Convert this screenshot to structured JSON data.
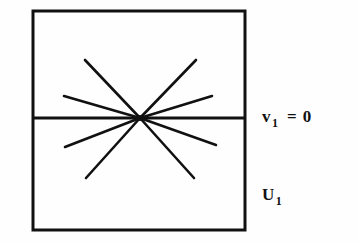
{
  "figure": {
    "kind": "math-diagram",
    "stroke_color": "#111111",
    "background_color": "#fefefe",
    "box": {
      "x": 33,
      "y": 11,
      "width": 212,
      "height": 219,
      "stroke_width": 3
    },
    "divider_line": {
      "x1": 33,
      "y1": 118,
      "x2": 245,
      "y2": 118,
      "stroke_width": 3
    },
    "center_point": {
      "x": 140,
      "y": 118
    },
    "rays": [
      {
        "name": "ray-upper-left-outer",
        "x": 64,
        "y": 96,
        "half": "upper"
      },
      {
        "name": "ray-upper-left-inner",
        "x": 85,
        "y": 60,
        "half": "upper"
      },
      {
        "name": "ray-upper-right-inner",
        "x": 196,
        "y": 60,
        "half": "upper"
      },
      {
        "name": "ray-upper-right-outer",
        "x": 212,
        "y": 96,
        "half": "upper"
      },
      {
        "name": "ray-lower-left-outer",
        "x": 65,
        "y": 147,
        "half": "lower"
      },
      {
        "name": "ray-lower-left-inner",
        "x": 86,
        "y": 178,
        "half": "lower"
      },
      {
        "name": "ray-lower-right-inner",
        "x": 194,
        "y": 178,
        "half": "lower"
      },
      {
        "name": "ray-lower-right-outer",
        "x": 216,
        "y": 145,
        "half": "lower"
      }
    ]
  },
  "labels": {
    "upper": {
      "symbol": "v",
      "subscript": "1",
      "operator": "=",
      "value": "0",
      "full_text": "v1 = 0"
    },
    "lower": {
      "symbol": "U",
      "subscript": "1",
      "full_text": "U1"
    }
  }
}
